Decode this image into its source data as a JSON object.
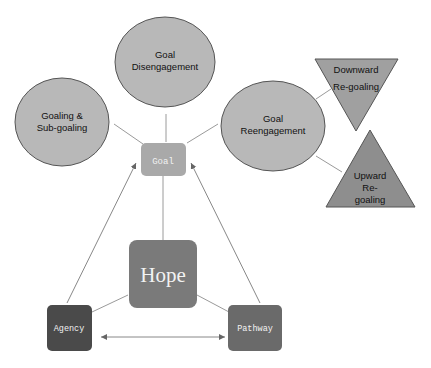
{
  "diagram": {
    "center": {
      "label": "Hope",
      "color": "#7a7a7a"
    },
    "goal": {
      "label": "Goal",
      "color": "#a9a9a9"
    },
    "agency": {
      "label": "Agency",
      "color": "#4a4a4a"
    },
    "pathway": {
      "label": "Pathway",
      "color": "#6a6a6a"
    },
    "ellipses": [
      {
        "line1": "Goal",
        "line2": "Disengagement"
      },
      {
        "line1": "Goaling &",
        "line2": "Sub-goaling"
      },
      {
        "line1": "Goal",
        "line2": "Reengagement"
      }
    ],
    "triangles": [
      {
        "direction": "down",
        "line1": "Downward",
        "line2": "Re-goaling"
      },
      {
        "direction": "up",
        "line1": "Upward",
        "line2": "Re-",
        "line3": "goaling"
      }
    ],
    "colors": {
      "ellipse_fill": "#b8b8b8",
      "triangle_down_fill": "#a0a0a0",
      "triangle_up_fill": "#8e8e8e",
      "stroke": "#555555",
      "connector": "#999999"
    }
  }
}
